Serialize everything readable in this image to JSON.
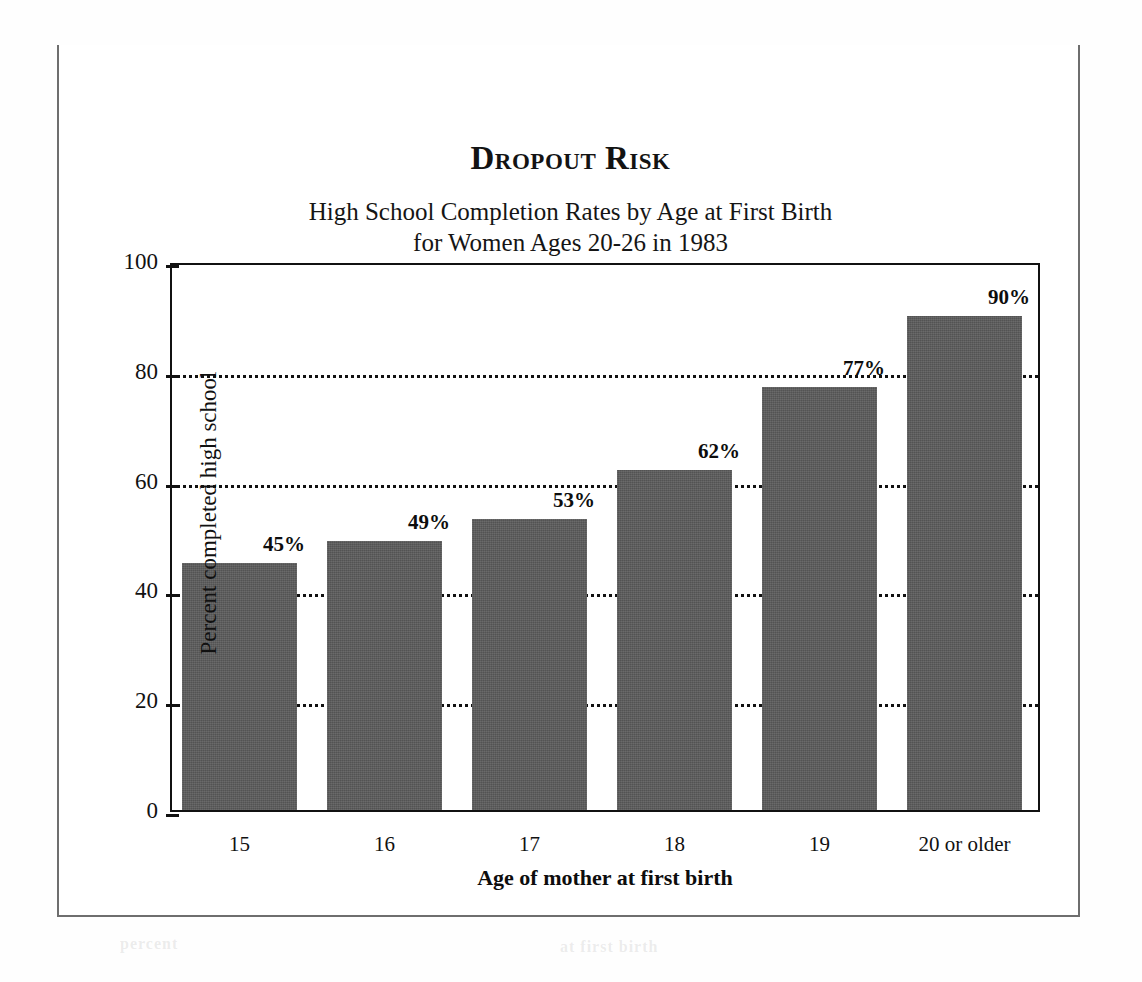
{
  "figure": {
    "title": "Dropout Risk",
    "subtitle_line1": "High School Completion Rates by Age at First Birth",
    "subtitle_line2": "for Women Ages 20-26 in 1983"
  },
  "ghost_text": {
    "g1": "A STATISTICAL PORTRAIT",
    "g2": "in 1983",
    "g3": "and the",
    "g4": "of mothers",
    "g5": "percent",
    "g6": "at first birth"
  },
  "colors": {
    "bar_fill": "#5b5b5b",
    "frame": "#6b6b6b",
    "axis": "#111111",
    "text": "#131313",
    "background": "#ffffff"
  },
  "chart_data": {
    "type": "bar",
    "title": "Dropout Risk",
    "subtitle": "High School Completion Rates by Age at First Birth for Women Ages 20-26 in 1983",
    "xlabel": "Age of mother at first birth",
    "ylabel": "Percent completed high school",
    "categories": [
      "15",
      "16",
      "17",
      "18",
      "19",
      "20 or older"
    ],
    "values": [
      45,
      49,
      53,
      62,
      77,
      90
    ],
    "value_labels": [
      "45%",
      "49%",
      "53%",
      "62%",
      "77%",
      "90%"
    ],
    "ylim": [
      0,
      100
    ],
    "yticks": [
      0,
      20,
      40,
      60,
      80,
      100
    ],
    "ytick_labels": [
      "0",
      "20",
      "40",
      "60",
      "80",
      "100"
    ],
    "gridlines_at": [
      20,
      40,
      60,
      80
    ],
    "grid": "dotted-horizontal",
    "legend": "none",
    "series": [
      {
        "name": "Percent completed high school",
        "values": [
          45,
          49,
          53,
          62,
          77,
          90
        ]
      }
    ]
  }
}
